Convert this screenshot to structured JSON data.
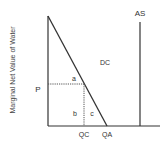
{
  "diagram": {
    "y_axis_label": "Marginal Net Value of Water",
    "labels": {
      "price": "P",
      "supply": "AS",
      "demand_region": "DC",
      "area_a": "a",
      "area_b": "b",
      "area_c": "c",
      "quantity_c": "QC",
      "quantity_a": "QA"
    },
    "colors": {
      "line": "#333333",
      "dotted": "#555555",
      "background": "#ffffff"
    }
  }
}
